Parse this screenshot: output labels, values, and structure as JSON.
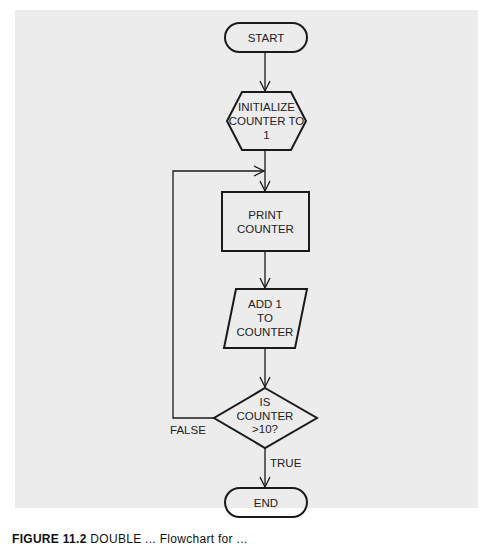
{
  "diagram": {
    "type": "flowchart",
    "nodes": [
      {
        "id": "start",
        "shape": "terminator",
        "label": "START"
      },
      {
        "id": "init",
        "shape": "hexagon",
        "lines": [
          "INITIALIZE",
          "COUNTER TO",
          "1"
        ]
      },
      {
        "id": "print",
        "shape": "rectangle",
        "lines": [
          "PRINT",
          "COUNTER"
        ]
      },
      {
        "id": "add",
        "shape": "parallelogram",
        "lines": [
          "ADD 1",
          "TO",
          "COUNTER"
        ]
      },
      {
        "id": "decision",
        "shape": "diamond",
        "lines": [
          "IS",
          "COUNTER",
          ">10?"
        ]
      },
      {
        "id": "end",
        "shape": "terminator",
        "label": "END"
      }
    ],
    "edges": [
      {
        "from": "start",
        "to": "init"
      },
      {
        "from": "init",
        "to": "print"
      },
      {
        "from": "print",
        "to": "add"
      },
      {
        "from": "add",
        "to": "decision"
      },
      {
        "from": "decision",
        "to": "print",
        "label": "FALSE"
      },
      {
        "from": "decision",
        "to": "end",
        "label": "TRUE"
      }
    ],
    "edge_labels": {
      "false": "FALSE",
      "true": "TRUE"
    }
  },
  "caption": {
    "figure": "FIGURE 11.2",
    "text": "DOUBLE ... Flowchart for ... "
  },
  "colors": {
    "panel": "#ececec",
    "stroke": "#1a1a1a",
    "text": "#222222"
  }
}
